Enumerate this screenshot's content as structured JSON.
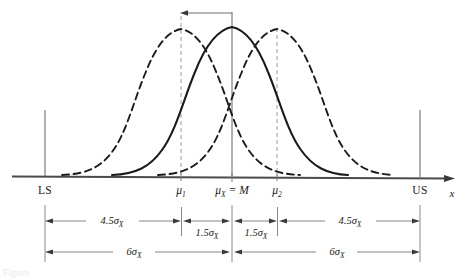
{
  "figure": {
    "axis_name": "x",
    "colors": {
      "ink": "#1a1a1a",
      "curve_solid": "#1b1b1b",
      "curve_dashed": "#1b1b1b",
      "guide_line": "#8a8a8a",
      "axis": "#3a3a3a",
      "background": "#ffffff"
    }
  },
  "axis": {
    "limits": [
      {
        "id": "lower-spec-limit",
        "label": "LS",
        "x": 45
      },
      {
        "id": "upper-spec-limit",
        "label": "US",
        "x": 420
      }
    ],
    "means": [
      {
        "id": "mu-1",
        "label": "μ",
        "subscript": "1",
        "x": 181
      },
      {
        "id": "mu-x-center",
        "label": "μ",
        "subscript": "X",
        "suffix": " = M",
        "x": 232
      },
      {
        "id": "mu-2",
        "label": "μ",
        "subscript": "2",
        "x": 277
      }
    ],
    "baseline_y": 176,
    "axis_end_x": 455
  },
  "curves": [
    {
      "id": "curve-mu1",
      "style": "dashed",
      "peak_x": 181,
      "peak_y": 29,
      "start_x": 62,
      "end_x": 300,
      "has_guide_line": true,
      "description": "Shifted-left normal distribution centered at mu 1"
    },
    {
      "id": "curve-center",
      "style": "solid",
      "peak_x": 232,
      "peak_y": 27,
      "start_x": 112,
      "end_x": 348,
      "has_guide_line": true,
      "description": "Centered normal distribution at mu X equals M"
    },
    {
      "id": "curve-mu2",
      "style": "dashed",
      "peak_x": 277,
      "peak_y": 29,
      "start_x": 158,
      "end_x": 394,
      "has_guide_line": true,
      "description": "Shifted-right normal distribution centered at mu 2"
    }
  ],
  "shift_arrow": {
    "id": "mean-shift-arrow",
    "from_x": 232,
    "to_x": 181,
    "y": 13,
    "direction": "left",
    "description": "Arrow showing the mean shift from center to mu 1"
  },
  "dimensions": {
    "row1": {
      "y": 221,
      "segments": [
        {
          "id": "dim-ls-to-mu1",
          "label": "4.5σ",
          "subscript": "X",
          "x1": 45,
          "x2": 181
        },
        {
          "id": "dim-mu1-to-center",
          "label": "1.5σ",
          "subscript": "X",
          "x1": 183,
          "x2": 230
        },
        {
          "id": "dim-center-to-mu2",
          "label": "1.5σ",
          "subscript": "X",
          "x1": 234,
          "x2": 277
        },
        {
          "id": "dim-mu2-to-us",
          "label": "4.5σ",
          "subscript": "X",
          "x1": 279,
          "x2": 420
        }
      ]
    },
    "row2": {
      "y": 252,
      "segments": [
        {
          "id": "dim-ls-to-center",
          "label": "6σ",
          "subscript": "X",
          "x1": 45,
          "x2": 230
        },
        {
          "id": "dim-center-to-us",
          "label": "6σ",
          "subscript": "X",
          "x1": 234,
          "x2": 420
        }
      ]
    },
    "extension_lines": [
      {
        "id": "ext-line-ls",
        "x": 45,
        "y1": 205,
        "y2": 262
      },
      {
        "id": "ext-line-mu1",
        "x": 181,
        "y1": 207,
        "y2": 235
      },
      {
        "id": "ext-line-center",
        "x": 232,
        "y1": 205,
        "y2": 262
      },
      {
        "id": "ext-line-mu2",
        "x": 277,
        "y1": 207,
        "y2": 235
      },
      {
        "id": "ext-line-us",
        "x": 420,
        "y1": 205,
        "y2": 262
      }
    ]
  },
  "caption": {
    "text": "Figure"
  }
}
